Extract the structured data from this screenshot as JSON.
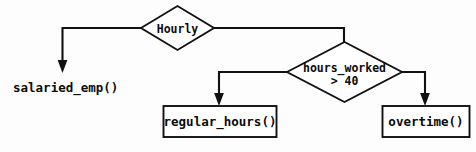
{
  "diagram": {
    "background_color": "#fdfdfd",
    "line_color": "#111111",
    "text_color": "#0b0b0b"
  },
  "nodes": {
    "hourly_decision": {
      "label": "Hourly",
      "shape": "diamond"
    },
    "hours_worked_decision": {
      "label_line1": "hours_worked",
      "label_line2": "> 40",
      "shape": "diamond"
    },
    "salaried_emp": {
      "label": "salaried_emp()",
      "shape": "text"
    },
    "regular_hours": {
      "label": "regular_hours()",
      "shape": "rectangle"
    },
    "overtime": {
      "label": "overtime()",
      "shape": "rectangle"
    }
  },
  "edges": [
    {
      "name": "hourly-to-salaried",
      "from": "hourly_decision",
      "to": "salaried_emp",
      "label": ""
    },
    {
      "name": "hourly-to-hours-worked",
      "from": "hourly_decision",
      "to": "hours_worked_decision",
      "label": ""
    },
    {
      "name": "hours-worked-to-regular-hours",
      "from": "hours_worked_decision",
      "to": "regular_hours",
      "label": ""
    },
    {
      "name": "hours-worked-to-overtime",
      "from": "hours_worked_decision",
      "to": "overtime",
      "label": ""
    }
  ]
}
